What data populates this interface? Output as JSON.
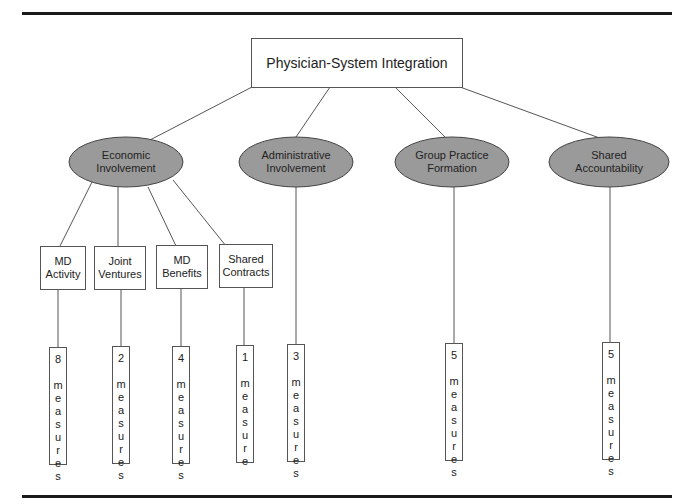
{
  "diagram": {
    "title": "Physician-System Integration",
    "categories": [
      {
        "id": "economic",
        "label_line1": "Economic",
        "label_line2": "Involvement"
      },
      {
        "id": "administrative",
        "label_line1": "Administrative",
        "label_line2": "Involvement"
      },
      {
        "id": "group",
        "label_line1": "Group Practice",
        "label_line2": "Formation"
      },
      {
        "id": "shared",
        "label_line1": "Shared",
        "label_line2": "Accountability"
      }
    ],
    "economic_subcategories": [
      {
        "label_line1": "MD",
        "label_line2": "Activity"
      },
      {
        "label_line1": "Joint",
        "label_line2": "Ventures"
      },
      {
        "label_line1": "MD",
        "label_line2": "Benefits"
      },
      {
        "label_line1": "Shared",
        "label_line2": "Contracts"
      }
    ],
    "measures": [
      {
        "count": "8",
        "word": "measures",
        "parent": "MD Activity"
      },
      {
        "count": "2",
        "word": "measures",
        "parent": "Joint Ventures"
      },
      {
        "count": "4",
        "word": "measures",
        "parent": "MD Benefits"
      },
      {
        "count": "1",
        "word": "measure",
        "parent": "Shared Contracts"
      },
      {
        "count": "3",
        "word": "measures",
        "parent": "Administrative Involvement"
      },
      {
        "count": "5",
        "word": "measures",
        "parent": "Group Practice Formation"
      },
      {
        "count": "5",
        "word": "measures",
        "parent": "Shared Accountability"
      }
    ],
    "colors": {
      "ellipse_fill": "#9a9a9a",
      "stroke": "#444444",
      "rule": "#1a1a1a"
    }
  }
}
